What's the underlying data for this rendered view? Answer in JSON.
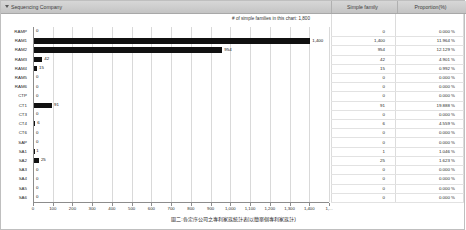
{
  "header": {
    "sequencing_company_label": "Sequencing Company",
    "simple_family_label": "Simple family",
    "proportion_label": "Proportion(%)",
    "sort_icon": "sort-descending-icon"
  },
  "chart_caption": "# of simple families in this chart: 1,800",
  "footer_caption": "圖二:各定序公司之專利家族統計表(以簡單個專利家族計)",
  "chart_data": {
    "type": "bar",
    "title": "# of simple families in this chart: 1,800",
    "xlabel": "",
    "ylabel": "",
    "orientation": "horizontal",
    "grid": true,
    "legend": "none",
    "xlim": [
      0,
      1400
    ],
    "xticks": [
      "0",
      "100",
      "200",
      "300",
      "400",
      "500",
      "600",
      "700",
      "800",
      "900",
      "1,000",
      "1,100",
      "1,200",
      "1,300",
      "1,400",
      "1,..."
    ],
    "xtick_values": [
      0,
      100,
      200,
      300,
      400,
      500,
      600,
      700,
      800,
      900,
      1000,
      1100,
      1200,
      1300,
      1400,
      1500
    ],
    "categories": [
      "RAMP",
      "RAM1",
      "RAM2",
      "RAM3",
      "RAM4",
      "RAM5",
      "RAM6",
      "CTP",
      "CT1",
      "CT3",
      "CT4",
      "CT6",
      "SAP",
      "SA1",
      "SA2",
      "SA3",
      "SA4",
      "SA5",
      "SA6"
    ],
    "values": [
      0,
      1400,
      954,
      42,
      15,
      0,
      0,
      0,
      91,
      0,
      6,
      0,
      0,
      1,
      25,
      0,
      0,
      0,
      0
    ],
    "value_labels": [
      "0",
      "1,400",
      "954",
      "42",
      "15",
      "0",
      "0",
      "0",
      "91",
      "0",
      "6",
      "0",
      "0",
      "1",
      "25",
      "0",
      "0",
      "0",
      "0"
    ]
  },
  "table": {
    "rows": [
      {
        "category": "RAMP",
        "bar_label": "0",
        "simple_family": "0",
        "proportion": "0.000 %"
      },
      {
        "category": "RAM1",
        "bar_label": "1,400",
        "simple_family": "1,400",
        "proportion": "11.964 %"
      },
      {
        "category": "RAM2",
        "bar_label": "954",
        "simple_family": "954",
        "proportion": "12.129 %"
      },
      {
        "category": "RAM3",
        "bar_label": "42",
        "simple_family": "42",
        "proportion": "4.901 %"
      },
      {
        "category": "RAM4",
        "bar_label": "15",
        "simple_family": "15",
        "proportion": "0.992 %"
      },
      {
        "category": "RAM5",
        "bar_label": "0",
        "simple_family": "0",
        "proportion": "0.000 %"
      },
      {
        "category": "RAM6",
        "bar_label": "0",
        "simple_family": "0",
        "proportion": "0.000 %"
      },
      {
        "category": "CTP",
        "bar_label": "0",
        "simple_family": "0",
        "proportion": "0.000 %"
      },
      {
        "category": "CT1",
        "bar_label": "91",
        "simple_family": "91",
        "proportion": "19.888 %"
      },
      {
        "category": "CT3",
        "bar_label": "0",
        "simple_family": "0",
        "proportion": "0.000 %"
      },
      {
        "category": "CT4",
        "bar_label": "6",
        "simple_family": "6",
        "proportion": "4.559 %"
      },
      {
        "category": "CT6",
        "bar_label": "0",
        "simple_family": "0",
        "proportion": "0.000 %"
      },
      {
        "category": "SAP",
        "bar_label": "0",
        "simple_family": "0",
        "proportion": "0.000 %"
      },
      {
        "category": "SA1",
        "bar_label": "1",
        "simple_family": "1",
        "proportion": "1.046 %"
      },
      {
        "category": "SA2",
        "bar_label": "25",
        "simple_family": "25",
        "proportion": "1.623 %"
      },
      {
        "category": "SA3",
        "bar_label": "0",
        "simple_family": "0",
        "proportion": "0.000 %"
      },
      {
        "category": "SA4",
        "bar_label": "0",
        "simple_family": "0",
        "proportion": "0.000 %"
      },
      {
        "category": "SA5",
        "bar_label": "0",
        "simple_family": "0",
        "proportion": "0.000 %"
      },
      {
        "category": "SA6",
        "bar_label": "0",
        "simple_family": "0",
        "proportion": "0.000 %"
      }
    ]
  },
  "colors": {
    "bar": "#111111",
    "grid": "#d9d9d9",
    "header_bg": "#cccccc",
    "axis": "#8c8c8c"
  }
}
